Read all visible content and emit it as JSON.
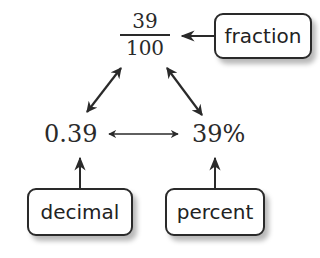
{
  "diagram": {
    "fraction_value": {
      "numerator": "39",
      "denominator": "100"
    },
    "decimal_value": "0.39",
    "percent_value": "39%",
    "labels": {
      "fraction": "fraction",
      "decimal": "decimal",
      "percent": "percent"
    },
    "relations": [
      {
        "from": "fraction_value",
        "to": "decimal_value",
        "type": "double-arrow"
      },
      {
        "from": "fraction_value",
        "to": "percent_value",
        "type": "double-arrow"
      },
      {
        "from": "decimal_value",
        "to": "percent_value",
        "type": "double-arrow"
      },
      {
        "from": "label-fraction",
        "to": "fraction_value",
        "type": "arrow"
      },
      {
        "from": "label-decimal",
        "to": "decimal_value",
        "type": "arrow"
      },
      {
        "from": "label-percent",
        "to": "percent_value",
        "type": "arrow"
      }
    ],
    "colors": {
      "ink": "#2a2a2a",
      "background": "#ffffff"
    }
  }
}
